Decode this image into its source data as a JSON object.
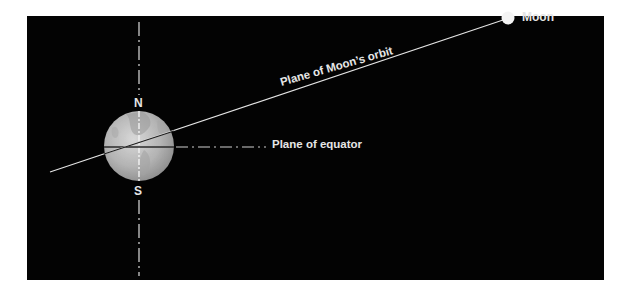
{
  "diagram": {
    "background_color": "#030303",
    "text_color": "#e6e6e6",
    "labels": {
      "moon": "Moon",
      "orbit_plane": "Plane of Moon’s orbit",
      "equator_plane": "Plane of equator",
      "north_pole": "N",
      "south_pole": "S"
    },
    "elements": {
      "earth": "globe",
      "moon": "white-dot",
      "axis": "dash-dot vertical line",
      "equator_line": "dash-dot horizontal line",
      "orbit_line": "solid inclined line"
    }
  }
}
